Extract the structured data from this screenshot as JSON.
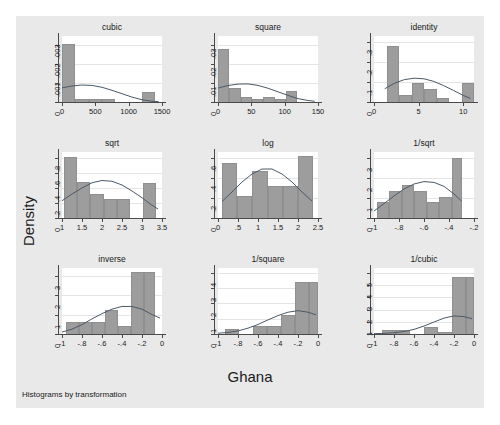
{
  "figure": {
    "ylabel": "Density",
    "xlabel": "Ghana",
    "note": "Histograms by transformation",
    "top_cutoff_text": "",
    "bar_color": "#9d9d9d",
    "plot_bg": "#ffffff",
    "canvas_bg": "#e9e9e9",
    "density_line_color": "#4a5a68"
  },
  "chart_data": {
    "type": "bar",
    "title": "Histograms by transformation",
    "xlabel": "Ghana",
    "ylabel": "Density",
    "grid": true,
    "legend": "none",
    "layout": "3x3 small-multiples histogram matrix with overlaid normal density curves",
    "panels": [
      {
        "title": "cubic",
        "xlim": [
          0,
          1500
        ],
        "ylim": [
          0,
          0.0035
        ],
        "xticks": [
          "0",
          "500",
          "1000",
          "1500"
        ],
        "xtick_values": [
          0,
          500,
          1000,
          1500
        ],
        "yticks": [
          "0",
          ".001",
          ".002",
          ".003"
        ],
        "ytick_values": [
          0,
          0.001,
          0.002,
          0.003
        ],
        "bin_edges": [
          0,
          200,
          400,
          600,
          800,
          1000,
          1200,
          1400
        ],
        "values": [
          0.00306,
          0.00017,
          0.00017,
          0.00017,
          0.0,
          0.0,
          0.00052
        ],
        "density_curve": {
          "x": [
            0,
            150,
            300,
            450,
            600,
            750,
            900,
            1050,
            1200,
            1350,
            1450
          ],
          "y": [
            0.00075,
            0.00085,
            0.0009,
            0.00088,
            0.00078,
            0.00062,
            0.00044,
            0.00026,
            0.00012,
            4e-05,
            2e-05
          ]
        }
      },
      {
        "title": "square",
        "xlim": [
          0,
          150
        ],
        "ylim": [
          0,
          0.035
        ],
        "xticks": [
          "0",
          "50",
          "100",
          "150"
        ],
        "xtick_values": [
          0,
          50,
          100,
          150
        ],
        "yticks": [
          "0",
          ".01",
          ".02",
          ".03"
        ],
        "ytick_values": [
          0,
          0.01,
          0.02,
          0.03
        ],
        "bin_edges": [
          0,
          17,
          34,
          51,
          68,
          85,
          102,
          119
        ],
        "values": [
          0.0281,
          0.0073,
          0.0028,
          0.0018,
          0.0028,
          0.0018,
          0.0059
        ],
        "density_curve": {
          "x": [
            0,
            15,
            30,
            45,
            60,
            75,
            90,
            105,
            120,
            135,
            145
          ],
          "y": [
            0.0074,
            0.0087,
            0.0095,
            0.0096,
            0.0088,
            0.0073,
            0.0054,
            0.0035,
            0.0018,
            0.0008,
            0.0004
          ]
        }
      },
      {
        "title": "identity",
        "xlim": [
          0,
          11.2
        ],
        "ylim": [
          0,
          0.33
        ],
        "xticks": [
          "0",
          "5",
          "10"
        ],
        "xtick_values": [
          0,
          5,
          10
        ],
        "yticks": [
          "0",
          ".1",
          ".2",
          ".3"
        ],
        "ytick_values": [
          0,
          0.1,
          0.2,
          0.3
        ],
        "bin_edges": [
          1.4,
          2.8,
          4.2,
          5.6,
          7.0,
          8.4,
          9.8,
          11.2
        ],
        "values": [
          0.281,
          0.036,
          0.094,
          0.066,
          0.018,
          0.0,
          0.094
        ],
        "density_curve": {
          "x": [
            1.2,
            2.3,
            3.4,
            4.5,
            5.6,
            6.7,
            7.8,
            8.9,
            10.0,
            10.8
          ],
          "y": [
            0.066,
            0.094,
            0.112,
            0.119,
            0.116,
            0.103,
            0.082,
            0.058,
            0.033,
            0.018
          ]
        }
      },
      {
        "title": "sqrt",
        "xlim": [
          1.0,
          3.5
        ],
        "ylim": [
          0,
          0.88
        ],
        "xticks": [
          "1",
          "1.5",
          "2",
          "2.5",
          "3",
          "3.5"
        ],
        "xtick_values": [
          1,
          1.5,
          2,
          2.5,
          3,
          3.5
        ],
        "yticks": [
          "0",
          ".2",
          ".4",
          ".6",
          ".8"
        ],
        "ytick_values": [
          0,
          0.2,
          0.4,
          0.6,
          0.8
        ],
        "bin_edges": [
          1.05,
          1.38,
          1.71,
          2.04,
          2.37,
          2.7,
          3.03,
          3.36
        ],
        "values": [
          0.82,
          0.48,
          0.32,
          0.25,
          0.25,
          0.0,
          0.47
        ],
        "density_curve": {
          "x": [
            1.0,
            1.25,
            1.5,
            1.75,
            2.0,
            2.25,
            2.5,
            2.75,
            3.0,
            3.25,
            3.4
          ],
          "y": [
            0.23,
            0.32,
            0.4,
            0.47,
            0.5,
            0.49,
            0.44,
            0.36,
            0.27,
            0.17,
            0.12
          ]
        }
      },
      {
        "title": "log",
        "xlim": [
          0,
          2.5
        ],
        "ylim": [
          0,
          0.66
        ],
        "xticks": [
          "0",
          ".5",
          "1",
          "1.5",
          "2",
          "2.5"
        ],
        "xtick_values": [
          0,
          0.5,
          1,
          1.5,
          2,
          2.5
        ],
        "yticks": [
          "0",
          ".2",
          ".4",
          ".6"
        ],
        "ytick_values": [
          0,
          0.2,
          0.4,
          0.6
        ],
        "bin_edges": [
          0.1,
          0.48,
          0.86,
          1.24,
          1.62,
          2.0,
          2.38
        ],
        "values": [
          0.55,
          0.22,
          0.47,
          0.32,
          0.32,
          0.62
        ],
        "density_curve": {
          "x": [
            0.1,
            0.35,
            0.6,
            0.85,
            1.1,
            1.35,
            1.6,
            1.85,
            2.1,
            2.35
          ],
          "y": [
            0.165,
            0.26,
            0.36,
            0.44,
            0.49,
            0.49,
            0.44,
            0.36,
            0.26,
            0.17
          ]
        }
      },
      {
        "title": "1/sqrt",
        "xlim": [
          -1.0,
          -0.2
        ],
        "ylim": [
          0,
          3.3
        ],
        "xticks": [
          "-1",
          "-.8",
          "-.6",
          "-.4",
          "-.2"
        ],
        "xtick_values": [
          -1,
          -0.8,
          -0.6,
          -0.4,
          -0.2
        ],
        "yticks": [
          "0",
          "1",
          "2",
          "3"
        ],
        "ytick_values": [
          0,
          1,
          2,
          3
        ],
        "bin_edges": [
          -0.98,
          -0.88,
          -0.78,
          -0.68,
          -0.58,
          -0.48,
          -0.38,
          -0.3
        ],
        "values": [
          0.82,
          1.35,
          1.65,
          1.35,
          0.82,
          1.05,
          3.0
        ],
        "density_curve": {
          "x": [
            -1.0,
            -0.92,
            -0.84,
            -0.76,
            -0.68,
            -0.6,
            -0.52,
            -0.44,
            -0.36,
            -0.3
          ],
          "y": [
            0.35,
            0.72,
            1.1,
            1.45,
            1.7,
            1.82,
            1.78,
            1.58,
            1.2,
            0.85
          ]
        }
      },
      {
        "title": "inverse",
        "xlim": [
          -1.0,
          0.0
        ],
        "ylim": [
          0,
          3.4
        ],
        "xticks": [
          "-1",
          "-.8",
          "-.6",
          "-.4",
          "-.2",
          "0"
        ],
        "xtick_values": [
          -1,
          -0.8,
          -0.6,
          -0.4,
          -0.2,
          0
        ],
        "yticks": [
          "0",
          "1",
          "2",
          "3"
        ],
        "ytick_values": [
          0,
          1,
          2,
          3
        ],
        "bin_edges": [
          -0.96,
          -0.83,
          -0.7,
          -0.57,
          -0.44,
          -0.31,
          -0.18,
          -0.07
        ],
        "values": [
          0.62,
          0.62,
          0.62,
          1.22,
          0.4,
          3.18,
          3.18
        ],
        "density_curve": {
          "x": [
            -1.0,
            -0.9,
            -0.8,
            -0.7,
            -0.6,
            -0.5,
            -0.4,
            -0.3,
            -0.2,
            -0.1,
            -0.02
          ],
          "y": [
            0.1,
            0.25,
            0.48,
            0.78,
            1.05,
            1.28,
            1.42,
            1.42,
            1.28,
            1.0,
            0.82
          ]
        }
      },
      {
        "title": "1/square",
        "xlim": [
          -1.0,
          0.0
        ],
        "ylim": [
          0,
          4.3
        ],
        "xticks": [
          "-1",
          "-.8",
          "-.6",
          "-.4",
          "-.2",
          "0"
        ],
        "xtick_values": [
          -1,
          -0.8,
          -0.6,
          -0.4,
          -0.2,
          0
        ],
        "yticks": [
          "0",
          "1",
          "2",
          "3",
          "4"
        ],
        "ytick_values": [
          0,
          1,
          2,
          3,
          4
        ],
        "bin_edges": [
          -0.93,
          -0.79,
          -0.65,
          -0.51,
          -0.37,
          -0.23,
          -0.09,
          0.0
        ],
        "values": [
          0.35,
          0.0,
          0.55,
          0.55,
          1.22,
          3.4,
          3.4
        ],
        "density_curve": {
          "x": [
            -1.0,
            -0.9,
            -0.8,
            -0.7,
            -0.6,
            -0.5,
            -0.4,
            -0.3,
            -0.2,
            -0.1,
            -0.02
          ],
          "y": [
            0.05,
            0.1,
            0.2,
            0.38,
            0.62,
            0.92,
            1.2,
            1.42,
            1.52,
            1.42,
            1.25
          ]
        }
      },
      {
        "title": "1/cubic",
        "xlim": [
          -1.0,
          0.0
        ],
        "ylim": [
          0,
          5.4
        ],
        "xticks": [
          "-1",
          "-.8",
          "-.6",
          "-.4",
          "-.2",
          "0"
        ],
        "xtick_values": [
          -1,
          -0.8,
          -0.6,
          -0.4,
          -0.2,
          0
        ],
        "yticks": [
          "0",
          "1",
          "2",
          "3",
          "4",
          "5"
        ],
        "ytick_values": [
          0,
          1,
          2,
          3,
          4,
          5
        ],
        "bin_edges": [
          -0.92,
          -0.78,
          -0.64,
          -0.5,
          -0.36,
          -0.22,
          -0.08,
          0.0
        ],
        "values": [
          0.33,
          0.33,
          0.0,
          0.55,
          0.2,
          4.7,
          4.7
        ],
        "density_curve": {
          "x": [
            -1.0,
            -0.9,
            -0.8,
            -0.7,
            -0.6,
            -0.5,
            -0.4,
            -0.3,
            -0.2,
            -0.1,
            -0.02
          ],
          "y": [
            0.03,
            0.05,
            0.1,
            0.2,
            0.38,
            0.65,
            0.98,
            1.3,
            1.48,
            1.42,
            1.25
          ]
        }
      }
    ]
  }
}
